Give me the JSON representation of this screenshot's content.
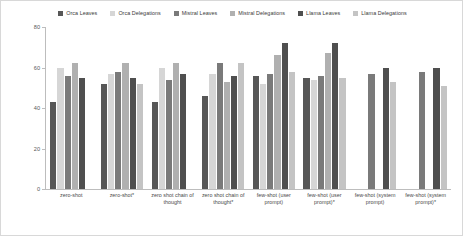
{
  "chart_data": {
    "type": "bar",
    "title": "",
    "xlabel": "",
    "ylabel": "",
    "ylim": [
      0,
      80
    ],
    "yticks": [
      0,
      20,
      40,
      60,
      80
    ],
    "grid": false,
    "legend_position": "top",
    "categories": [
      "zero-shot",
      "zero-shot*",
      "zero shot chain of thought",
      "zero shot chain of thought*",
      "few-shot (user prompt)",
      "few-shot (user prompt)*",
      "few-shot (system prompt)",
      "few-shot (system prompt)*"
    ],
    "series": [
      {
        "name": "Orca Leaves",
        "color": "#575757",
        "values": [
          43,
          52,
          43,
          46,
          56,
          55,
          null,
          null
        ]
      },
      {
        "name": "Orca Delegations",
        "color": "#d6d6d6",
        "values": [
          60,
          57,
          60,
          57,
          52,
          54,
          null,
          null
        ]
      },
      {
        "name": "Mistral Leaves",
        "color": "#7a7a7a",
        "values": [
          56,
          58,
          54,
          62,
          57,
          56,
          57,
          58
        ]
      },
      {
        "name": "Mistral Delegations",
        "color": "#b0b0b0",
        "values": [
          62,
          62,
          62,
          53,
          66,
          67,
          null,
          null
        ]
      },
      {
        "name": "Llama Leaves",
        "color": "#4f4f4f",
        "values": [
          55,
          55,
          57,
          56,
          72,
          72,
          60,
          60
        ]
      },
      {
        "name": "Llama Delegations",
        "color": "#c4c4c4",
        "values": [
          null,
          52,
          null,
          62,
          58,
          55,
          53,
          51
        ]
      }
    ]
  },
  "legend": {
    "items": [
      {
        "label": "Orca Leaves",
        "color": "#575757"
      },
      {
        "label": "Orca Delegations",
        "color": "#d6d6d6"
      },
      {
        "label": "Mistral Leaves",
        "color": "#7a7a7a"
      },
      {
        "label": "Mistral Delegations",
        "color": "#b0b0b0"
      },
      {
        "label": "Llama Leaves",
        "color": "#4f4f4f"
      },
      {
        "label": "Llama Delegations",
        "color": "#c4c4c4"
      }
    ]
  }
}
